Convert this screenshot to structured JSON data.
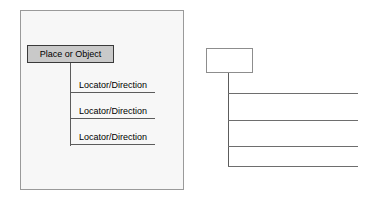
{
  "diagram": {
    "example": {
      "panel_name": "example-panel",
      "root_label": "Place or Object",
      "entries": [
        {
          "label": "Locator/Direction"
        },
        {
          "label": "Locator/Direction"
        },
        {
          "label": "Locator/Direction"
        }
      ]
    },
    "template": {
      "panel_name": "blank-template",
      "root_label": "",
      "entries": [
        {
          "label": ""
        },
        {
          "label": ""
        },
        {
          "label": ""
        },
        {
          "label": ""
        }
      ]
    }
  },
  "colors": {
    "panel_background": "#f7f7f7",
    "panel_border": "#9a9a9a",
    "node_fill": "#c9c9c9",
    "node_border": "#3a3a3a",
    "line": "#5c5c5c",
    "template_line": "#6e6e6e",
    "text": "#000000",
    "page_background": "#ffffff"
  }
}
